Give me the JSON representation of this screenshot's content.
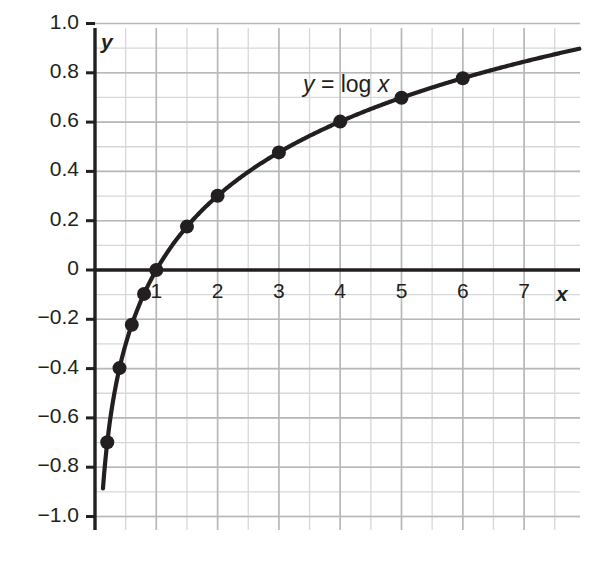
{
  "chart_data": {
    "type": "line",
    "title": "",
    "subtitle": "",
    "xlabel": "x",
    "ylabel": "y",
    "xlim": [
      -0.13,
      7.9
    ],
    "ylim": [
      -1.0,
      1.0
    ],
    "grid": true,
    "grid_minor_x_step": 0.5,
    "grid_minor_y_step": 0.1,
    "legend": "none",
    "annotation": "y = log x",
    "series": [
      {
        "name": "y = log x",
        "marker": "filled-circle",
        "color": "#231f20",
        "x": [
          0.2,
          0.4,
          0.6,
          0.8,
          1,
          1.5,
          2,
          3,
          4,
          5,
          6
        ],
        "values": [
          -0.7,
          -0.4,
          -0.22,
          -0.1,
          0,
          0.18,
          0.3,
          0.48,
          0.6,
          0.7,
          0.78
        ]
      }
    ],
    "curve": {
      "expression": "y = log10(x)",
      "x_start": 0.13,
      "x_end": 7.9
    },
    "xticks": [
      1,
      2,
      3,
      4,
      5,
      6,
      7
    ],
    "xtick_labels": [
      "1",
      "2",
      "3",
      "4",
      "5",
      "6",
      "7"
    ],
    "yticks": [
      1.0,
      0.8,
      0.6,
      0.4,
      0.2,
      0,
      -0.2,
      -0.4,
      -0.6,
      -0.8,
      -1.0
    ],
    "ytick_labels": [
      "1.0",
      "0.8",
      "0.6",
      "0.4",
      "0.2",
      "0",
      "−0.2",
      "−0.4",
      "−0.6",
      "−0.8",
      "−1.0"
    ]
  },
  "annotation_parts": {
    "y": "y",
    "equals": " = log ",
    "x": "x"
  },
  "axis_labels": {
    "x": "x",
    "y": "y"
  },
  "colors": {
    "ink": "#231f20",
    "grid_major": "#b6b8ba",
    "grid_minor": "#d7d8da",
    "background": "#ffffff"
  }
}
